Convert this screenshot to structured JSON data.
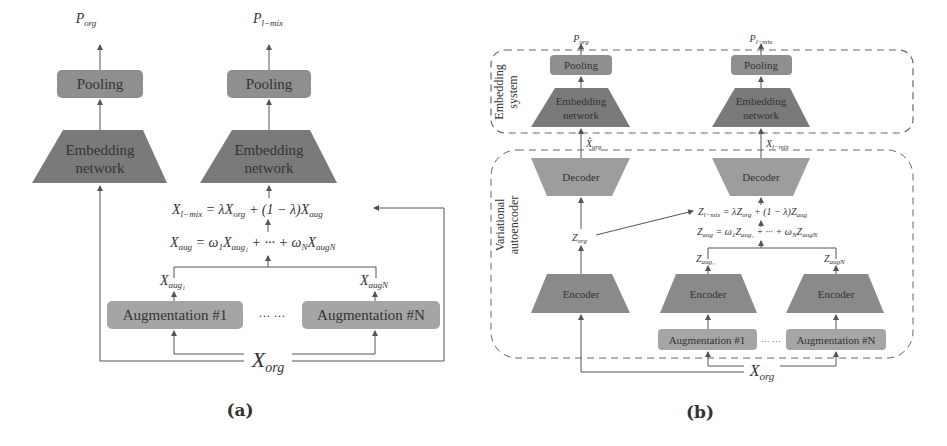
{
  "panels": {
    "a": {
      "caption": "(a)",
      "outputs": {
        "org": "P",
        "org_sub": "org",
        "mix": "P",
        "mix_sub": "l−mix"
      },
      "pooling_label": "Pooling",
      "embedding_label_line1": "Embedding",
      "embedding_label_line2": "network",
      "eq_mix": {
        "lhs": "X",
        "lhs_sub": "l−mix",
        "rhs": " = λX",
        "rhs_sub1": "org",
        "rhs2": " + (1 − λ)X",
        "rhs_sub2": "aug"
      },
      "eq_aug": {
        "lhs": "X",
        "lhs_sub": "aug",
        "rhs": " = ω",
        "w1_sub": "1",
        "x1": "X",
        "x1_sub": "aug₁",
        "mid": " + ··· + ω",
        "wn_sub": "N",
        "xn": "X",
        "xn_sub": "augN"
      },
      "aug_out_1": {
        "base": "X",
        "sub": "aug₁"
      },
      "aug_out_n": {
        "base": "X",
        "sub": "augN"
      },
      "aug_1_label": "Augmentation #1",
      "aug_n_label": "Augmentation #N",
      "ellipsis": "··· ···",
      "input": {
        "base": "X",
        "sub": "org"
      }
    },
    "b": {
      "caption": "(b)",
      "group_embedding_line1": "Embedding",
      "group_embedding_line2": "system",
      "group_vae_line1": "Variational",
      "group_vae_line2": "autoencoder",
      "outputs": {
        "org": "P",
        "org_sub": "org",
        "mix": "P",
        "mix_sub": "l−mix"
      },
      "pooling_label": "Pooling",
      "embedding_label_line1": "Embedding",
      "embedding_label_line2": "network",
      "decoder_label": "Decoder",
      "encoder_label": "Encoder",
      "recon_org": {
        "base": "X̂",
        "sub": "org"
      },
      "recon_mix": {
        "base": "X",
        "sub": "l−mix"
      },
      "z_org": {
        "base": "Z",
        "sub": "org"
      },
      "eq_mix": {
        "lhs": "Z",
        "lhs_sub": "l−mix",
        "rhs": " = λZ",
        "rhs_sub1": "org",
        "rhs2": " + (1 − λ)Z",
        "rhs_sub2": "aug"
      },
      "eq_aug": {
        "lhs": "Z",
        "lhs_sub": "aug",
        "rhs": " = ω",
        "w1_sub": "1",
        "x1": "Z",
        "x1_sub": "aug₁",
        "mid": " + ··· + ω",
        "wn_sub": "N",
        "xn": "Z",
        "xn_sub": "augN"
      },
      "z_aug_1": {
        "base": "Z",
        "sub": "aug₁"
      },
      "z_aug_n": {
        "base": "Z",
        "sub": "augN"
      },
      "aug_1_label": "Augmentation #1",
      "aug_n_label": "Augmentation #N",
      "ellipsis": "··· ···",
      "input": {
        "base": "X",
        "sub": "org"
      }
    }
  },
  "colors": {
    "pooling_fill": "#8f8f8f",
    "embedding_fill": "#7a7a7a",
    "decoder_fill": "#9d9d9d",
    "encoder_fill": "#8a8a8a",
    "aug_fill": "#a5a5a5",
    "line": "#555555",
    "dash": "#666666"
  }
}
